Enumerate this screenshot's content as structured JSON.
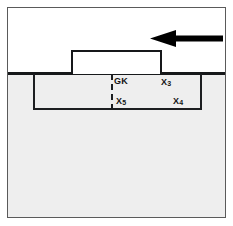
{
  "figure": {
    "type": "semiconductor-cross-section-diagram",
    "background_color": "#ffffff",
    "frame_color": "#5a5a5a",
    "substrate_color": "#eeeeee",
    "line_color": "#16181a"
  },
  "arrow": {
    "name": "left-pointing-arrow",
    "direction": "left",
    "color": "#000000"
  },
  "gate_block": {
    "name": "raised-gate-block",
    "fill": "#ffffff"
  },
  "well_region": {
    "name": "doped-well-region"
  },
  "junction": {
    "name": "dashed-junction-line",
    "style": "dashed"
  },
  "labels": {
    "gk": {
      "text": "GK",
      "base": "GK",
      "sub": ""
    },
    "x3": {
      "text": "X3",
      "base": "X",
      "sub": "3"
    },
    "x5": {
      "text": "X5",
      "base": "X",
      "sub": "5"
    },
    "x4": {
      "text": "X4",
      "base": "X",
      "sub": "4"
    }
  }
}
